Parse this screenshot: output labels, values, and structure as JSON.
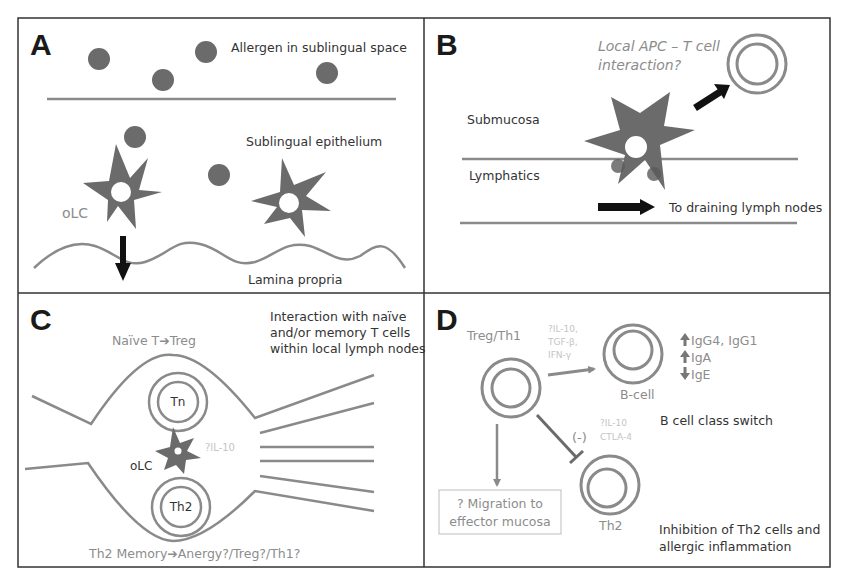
{
  "colors": {
    "cell_fill": "#6b6b6b",
    "line": "#8a8a8a",
    "border": "#333333",
    "dark_text": "#333333",
    "gray_text": "#8c8c8c",
    "faint_text": "#c4c4c4",
    "arrow": "#111111"
  },
  "panels": {
    "A": {
      "letter": "A",
      "allergen_label": "Allergen in sublingual space",
      "epithelium_label": "Sublingual epithelium",
      "cell_label": "oLC",
      "lamina_label": "Lamina propria"
    },
    "B": {
      "letter": "B",
      "question_line1": "Local APC – T cell",
      "question_line2": "interaction?",
      "submucosa_label": "Submucosa",
      "lymphatics_label": "Lymphatics",
      "drain_label": "To draining lymph nodes"
    },
    "C": {
      "letter": "C",
      "title_line1": "Interaction with naïve",
      "title_line2": "and/or memory T cells",
      "title_line3": "within local lymph nodes",
      "naive_label": "Naïve T➔Treg",
      "tn_label": "Tn",
      "olc_label": "oLC",
      "il10_label": "?IL-10",
      "th2_label": "Th2",
      "memory_label": "Th2 Memory➔Anergy?/Treg?/Th1?"
    },
    "D": {
      "letter": "D",
      "treg_label": "Treg/Th1",
      "cytokines": [
        "?IL-10,",
        "TGF-β,",
        "IFN-γ"
      ],
      "bcell_label": "B-cell",
      "ig_items": [
        {
          "direction": "up",
          "label": "IgG4, IgG1"
        },
        {
          "direction": "up",
          "label": "IgA"
        },
        {
          "direction": "down",
          "label": "IgE"
        }
      ],
      "class_switch_label": "B cell class switch",
      "inhibit_sign": "(-)",
      "inhibit_cytokines": [
        "?IL-10",
        "CTLA-4"
      ],
      "migration_line1": "? Migration to",
      "migration_line2": "effector mucosa",
      "th2_label": "Th2",
      "inhibition_line1": "Inhibition of Th2 cells and",
      "inhibition_line2": "allergic inflammation"
    }
  }
}
